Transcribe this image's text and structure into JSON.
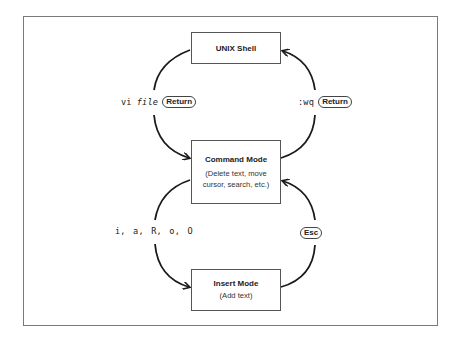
{
  "diagram": {
    "nodes": {
      "shell": {
        "title": "UNIX Shell"
      },
      "command": {
        "title": "Command Mode",
        "subtitle_line1": "(Delete text, move",
        "subtitle_line2": "cursor, search, etc.)"
      },
      "insert": {
        "title": "Insert Mode",
        "subtitle": "(Add text)"
      }
    },
    "edges": {
      "shell_to_command": {
        "cmd": "vi",
        "arg": "file",
        "key": "Return"
      },
      "command_to_shell": {
        "cmd": ":wq",
        "key": "Return"
      },
      "command_to_insert": {
        "cmd": "i, a, R, o, O"
      },
      "insert_to_command": {
        "key": "Esc"
      }
    },
    "colors": {
      "line": "#1a1a1a",
      "frame": "#7a7a7a",
      "box_border": "#555555"
    }
  }
}
